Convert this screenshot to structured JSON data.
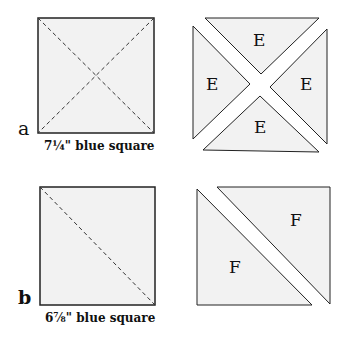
{
  "diagram_a": {
    "row_label": "a",
    "caption": "7¼\" blue square",
    "piece_labels": [
      "E",
      "E",
      "E",
      "E"
    ]
  },
  "diagram_b": {
    "row_label": "b",
    "caption": "6⅞\" blue square",
    "piece_labels": [
      "F",
      "F"
    ]
  },
  "colors": {
    "fill": "#f2f2f2",
    "stroke": "#222222",
    "background": "#ffffff"
  }
}
